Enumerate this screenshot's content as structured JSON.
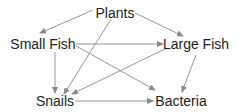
{
  "diagram": {
    "type": "food-web",
    "colors": {
      "text": "#222222",
      "edge": "#8a8a8a",
      "background": "#ffffff"
    },
    "nodes": [
      {
        "id": "plants",
        "label": "Plants",
        "x": 115,
        "y": 18
      },
      {
        "id": "small_fish",
        "label": "Small Fish",
        "x": 43,
        "y": 49
      },
      {
        "id": "large_fish",
        "label": "Large Fish",
        "x": 196,
        "y": 49
      },
      {
        "id": "snails",
        "label": "Snails",
        "x": 55,
        "y": 106
      },
      {
        "id": "bacteria",
        "label": "Bacteria",
        "x": 181,
        "y": 106
      }
    ],
    "edges": [
      {
        "from": "plants",
        "to": "small_fish",
        "x1": 93,
        "y1": 10,
        "x2": 40,
        "y2": 33
      },
      {
        "from": "plants",
        "to": "large_fish",
        "x1": 135,
        "y1": 13,
        "x2": 183,
        "y2": 36
      },
      {
        "from": "plants",
        "to": "snails",
        "x1": 111,
        "y1": 19,
        "x2": 64,
        "y2": 94
      },
      {
        "from": "small_fish",
        "to": "large_fish",
        "x1": 76,
        "y1": 44,
        "x2": 163,
        "y2": 44
      },
      {
        "from": "small_fish",
        "to": "bacteria",
        "x1": 76,
        "y1": 46,
        "x2": 155,
        "y2": 90
      },
      {
        "from": "small_fish",
        "to": "snails",
        "x1": 55,
        "y1": 52,
        "x2": 55,
        "y2": 93
      },
      {
        "from": "large_fish",
        "to": "snails",
        "x1": 167,
        "y1": 48,
        "x2": 72,
        "y2": 94
      },
      {
        "from": "large_fish",
        "to": "bacteria",
        "x1": 196,
        "y1": 55,
        "x2": 182,
        "y2": 92
      },
      {
        "from": "snails",
        "to": "bacteria",
        "x1": 75,
        "y1": 101,
        "x2": 153,
        "y2": 101
      }
    ]
  }
}
